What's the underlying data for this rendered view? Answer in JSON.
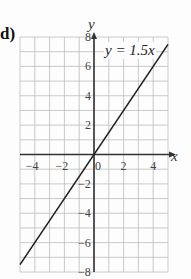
{
  "part_label": "d)",
  "equation_label": "y = 1.5x",
  "chart_data": {
    "type": "line",
    "title": "",
    "xlabel": "x",
    "ylabel": "y",
    "xlim": [
      -5,
      5
    ],
    "ylim": [
      -8,
      8
    ],
    "grid": true,
    "x_ticks": [
      -4,
      -2,
      0,
      2,
      4
    ],
    "y_ticks": [
      -8,
      -6,
      -4,
      -2,
      2,
      4,
      6,
      8
    ],
    "x_tick_labels": [
      "−4",
      "−2",
      "0",
      "2",
      "4"
    ],
    "y_tick_labels": [
      "−8",
      "−6",
      "−4",
      "−2",
      "2",
      "4",
      "6",
      "8"
    ],
    "series": [
      {
        "name": "y = 1.5x",
        "x": [
          -5,
          5
        ],
        "y": [
          -7.5,
          7.5
        ],
        "color": "#222222"
      }
    ],
    "legend": "inline annotation near top right"
  }
}
